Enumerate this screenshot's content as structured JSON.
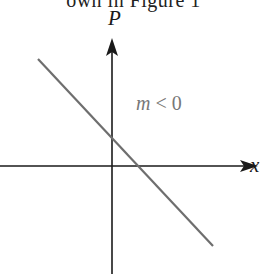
{
  "caption_fragment": "own in Figure 1",
  "diagram": {
    "y_axis_label": "P",
    "x_axis_label": "x",
    "annotation": "m < 0",
    "colors": {
      "axes": "#1a1a1a",
      "line": "#6e6e6e",
      "annotation": "#777777",
      "labels": "#1a1a1a"
    }
  }
}
